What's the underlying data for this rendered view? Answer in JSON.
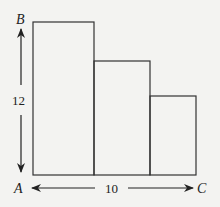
{
  "diagram": {
    "labels": {
      "top_left": "B",
      "bottom_left": "A",
      "bottom_right": "C",
      "height": "12",
      "width": "10"
    },
    "rectangles": [
      {
        "x": 33,
        "top": 22,
        "right": 94
      },
      {
        "x": 94,
        "top": 61,
        "right": 150
      },
      {
        "x": 150,
        "top": 96,
        "right": 196
      }
    ],
    "baseline_y": 175,
    "colors": {
      "stroke": "#333333",
      "background": "#f3f3f1"
    }
  }
}
